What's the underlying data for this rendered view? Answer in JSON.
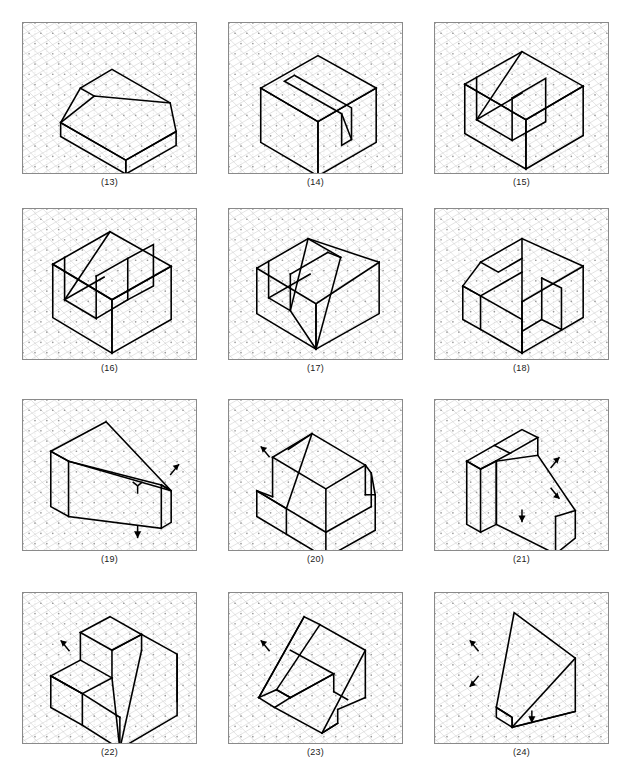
{
  "page": {
    "width": 633,
    "height": 778,
    "background": "#ffffff",
    "frame_color": "#8a8a8a",
    "line_color": "#000000",
    "grid_color": "#c8c8c8",
    "grid_dot_color": "#9a9a9a",
    "columns": 3,
    "rows": 4,
    "title": ""
  },
  "panels": [
    {
      "caption": "(13)",
      "x": 22,
      "y": 22,
      "w": 175,
      "h": 152,
      "caption_y": 177,
      "description": "truncated-wedge block, trapezoidal prism",
      "arrows": []
    },
    {
      "caption": "(14)",
      "x": 228,
      "y": 22,
      "w": 175,
      "h": 152,
      "caption_y": 177,
      "description": "rectangular block with angled slot cut",
      "arrows": []
    },
    {
      "caption": "(15)",
      "x": 434,
      "y": 22,
      "w": 175,
      "h": 152,
      "caption_y": 177,
      "description": "block with channel and chamfered web",
      "arrows": []
    },
    {
      "caption": "(16)",
      "x": 22,
      "y": 208,
      "w": 175,
      "h": 152,
      "caption_y": 363,
      "description": "U-channel block with inclined inner face",
      "arrows": []
    },
    {
      "caption": "(17)",
      "x": 228,
      "y": 208,
      "w": 175,
      "h": 152,
      "caption_y": 363,
      "description": "block with large bevel and narrow rib",
      "arrows": []
    },
    {
      "caption": "(18)",
      "x": 434,
      "y": 208,
      "w": 175,
      "h": 152,
      "caption_y": 363,
      "description": "block with inclined slot and corner notch",
      "arrows": []
    },
    {
      "caption": "(19)",
      "x": 22,
      "y": 399,
      "w": 175,
      "h": 152,
      "caption_y": 554,
      "description": "tapered wedge plate",
      "arrows": [
        {
          "x": 158,
          "y": 65,
          "dir": "ne",
          "name": "view-arrow-right"
        },
        {
          "x": 116,
          "y": 93,
          "dir": "down-fork",
          "name": "view-arrow-front"
        },
        {
          "x": 116,
          "y": 140,
          "dir": "down",
          "name": "view-arrow-bottom"
        }
      ]
    },
    {
      "caption": "(20)",
      "x": 228,
      "y": 399,
      "w": 175,
      "h": 152,
      "caption_y": 554,
      "description": "stepped block with inclined ramp face",
      "arrows": [
        {
          "x": 32,
          "y": 47,
          "dir": "nw",
          "name": "view-arrow-left"
        }
      ]
    },
    {
      "caption": "(21)",
      "x": 434,
      "y": 399,
      "w": 175,
      "h": 152,
      "caption_y": 554,
      "description": "tapered bracket with vertical back plate",
      "arrows": [
        {
          "x": 126,
          "y": 58,
          "dir": "ne",
          "name": "view-arrow-right-upper"
        },
        {
          "x": 126,
          "y": 100,
          "dir": "se",
          "name": "view-arrow-right-lower"
        },
        {
          "x": 88,
          "y": 124,
          "dir": "down",
          "name": "view-arrow-bottom"
        }
      ]
    },
    {
      "caption": "(22)",
      "x": 22,
      "y": 592,
      "w": 175,
      "h": 152,
      "caption_y": 747,
      "description": "stepped block with large inclined face",
      "arrows": [
        {
          "x": 38,
          "y": 48,
          "dir": "nw",
          "name": "view-arrow-left"
        }
      ]
    },
    {
      "caption": "(23)",
      "x": 228,
      "y": 592,
      "w": 175,
      "h": 152,
      "caption_y": 747,
      "description": "thin inclined bent plate, U-shaped",
      "arrows": [
        {
          "x": 32,
          "y": 48,
          "dir": "nw",
          "name": "view-arrow-left"
        }
      ]
    },
    {
      "caption": "(24)",
      "x": 434,
      "y": 592,
      "w": 175,
      "h": 152,
      "caption_y": 747,
      "description": "angled wedge plate viewed edge-on",
      "arrows": [
        {
          "x": 35,
          "y": 48,
          "dir": "nw",
          "name": "view-arrow-left-upper"
        },
        {
          "x": 35,
          "y": 95,
          "dir": "sw",
          "name": "view-arrow-left-lower"
        },
        {
          "x": 98,
          "y": 132,
          "dir": "down",
          "name": "view-arrow-bottom"
        }
      ]
    }
  ],
  "geometry": {
    "13": [
      "M 38 101 L 38 115 L 104 153 L 104 139 Z",
      "M 104 153 L 155 124 L 155 110 L 104 139 Z",
      "M 38 101 L 58 66 L 90 47 L 149 81 L 155 110 L 104 139 Z",
      "M 58 66 L 72 74",
      "M 38 101 L 72 74 L 149 81"
    ],
    "14": [
      "M 32 66 L 32 121 L 90 155 L 90 100 Z",
      "M 90 155 L 149 121 L 149 66 L 90 100 Z",
      "M 32 66 L 90 33 L 149 66 L 90 100 Z",
      "M 66 53 L 124 86 L 124 118 L 114 124 L 114 92 L 56 59 Z",
      "M 114 92 L 124 118"
    ],
    "15": [
      "M 30 62 L 30 112 L 92 148 L 92 98 Z",
      "M 92 148 L 150 114 L 150 64 L 92 98 Z",
      "M 30 62 L 88 29 L 150 64 L 92 98 Z",
      "M 42 55 L 42 98 L 78 119 L 78 76",
      "M 42 98 L 88 71",
      "M 88 29 L 42 98",
      "M 78 76 L 112 56 L 112 100 L 78 119"
    ],
    "16": [
      "M 30 56 L 30 110 L 90 146 L 90 92 Z",
      "M 90 146 L 150 112 L 150 58 L 90 92 Z",
      "M 30 56 L 88 23 L 150 58 L 90 92 Z",
      "M 42 49 L 42 92 L 74 111 L 74 68",
      "M 42 92 L 82 69",
      "M 88 23 L 42 92",
      "M 74 68 L 106 50 L 106 92 L 74 111",
      "M 106 50 L 132 36 L 132 78 L 106 92"
    ],
    "17": [
      "M 28 60 L 28 106 L 88 142 L 88 96 Z",
      "M 88 142 L 152 106 L 152 54 L 88 96 Z",
      "M 28 60 L 80 30 L 152 54",
      "M 40 53 L 40 90 L 62 103 L 62 66",
      "M 62 66 L 100 44",
      "M 40 90 L 82 66",
      "M 80 30 L 62 103",
      "M 80 30 L 113 49",
      "M 100 44 L 113 49",
      "M 113 49 L 88 142",
      "M 62 103 L 88 142"
    ],
    "18": [
      "M 28 78 L 28 112 L 46 122 L 46 88 Z",
      "M 46 122 L 88 146 L 88 112",
      "M 88 146 L 150 110 L 150 58 L 88 94 Z",
      "M 28 78 L 46 88 L 88 64",
      "M 46 54 L 88 30 L 150 58",
      "M 46 54 L 28 78",
      "M 46 54 L 64 64 L 88 50",
      "M 88 30 L 88 94",
      "M 88 94 L 88 146",
      "M 46 88 L 88 112",
      "M 108 70 L 108 112 L 88 124",
      "M 108 70 L 128 80 L 128 122 L 108 112",
      "M 88 124 L 88 146"
    ],
    "19": [
      "M 28 52 L 28 108 L 46 118 L 46 62 Z",
      "M 46 118 L 140 130 L 140 86",
      "M 28 52 L 84 22 L 150 92 L 140 86 L 46 62 Z",
      "M 140 86 L 150 92 L 150 124 L 140 130",
      "M 46 62 L 150 92"
    ],
    "20": [
      "M 28 92 L 28 118 L 58 136 L 58 110 Z",
      "M 58 136 L 98 160 L 98 134",
      "M 28 92 L 58 110 L 98 134 L 144 108",
      "M 44 58 L 44 98",
      "M 44 58 L 84 34 L 138 66 L 98 90 Z",
      "M 138 66 L 138 96",
      "M 98 90 L 98 134",
      "M 144 108 L 144 74",
      "M 84 34 L 58 110",
      "M 84 34 L 60 50",
      "M 28 92 L 44 98",
      "M 98 160 L 148 132 L 148 96 L 138 96",
      "M 148 96 L 144 74 L 138 66"
    ],
    "21": [
      "M 32 62 L 32 126 L 46 134 L 46 70 Z",
      "M 46 134 L 62 126 L 62 62",
      "M 32 62 L 60 46 L 76 54 L 46 70 Z",
      "M 60 46 L 88 30 L 104 38 L 76 54",
      "M 104 38 L 104 56",
      "M 62 62 L 62 126",
      "M 62 126 L 122 156 L 122 118",
      "M 62 62 L 104 56 L 142 112 L 122 118",
      "M 142 112 L 142 140 L 122 156",
      "M 46 70 L 62 62"
    ],
    "22": [
      "M 28 84 L 28 116 L 60 134 L 60 102 Z",
      "M 60 134 L 98 158 L 98 126",
      "M 28 84 L 60 102 L 98 126",
      "M 28 84 L 58 68 L 90 86 L 60 102 Z",
      "M 58 68 L 58 40",
      "M 58 40 L 88 24 L 120 42 L 90 58 Z",
      "M 90 58 L 90 86",
      "M 120 42 L 120 58",
      "M 120 42 L 156 62 L 156 110",
      "M 90 86 L 98 158",
      "M 98 158 L 156 124 L 156 62",
      "M 90 58 L 120 42",
      "M 98 158 L 120 58"
    ],
    "23": [
      "M 30 106 L 46 116 L 62 106 L 48 98 Z",
      "M 46 116 L 94 142 L 110 132",
      "M 30 106 L 76 24 L 92 32 L 48 98",
      "M 48 98 L 62 106",
      "M 62 106 L 106 82 L 106 100",
      "M 92 32 L 138 58 L 138 106",
      "M 106 82 L 62 106",
      "M 106 100 L 120 108",
      "M 94 142 L 110 132 L 110 118",
      "M 110 118 L 138 106",
      "M 76 24 L 30 106",
      "M 94 142 L 138 58",
      "M 62 58 L 106 82"
    ],
    "24": [
      "M 62 116 L 62 126 L 78 136 L 78 126 Z",
      "M 62 116 L 80 20 L 142 66 L 142 120 L 78 136 L 78 126 Z",
      "M 142 66 L 78 136",
      "M 142 120 L 78 136"
    ]
  }
}
